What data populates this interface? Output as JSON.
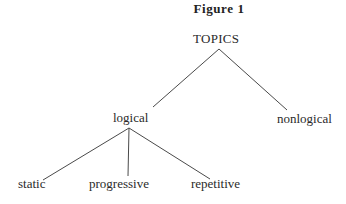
{
  "figure": {
    "title": "Figure 1"
  },
  "tree": {
    "root": {
      "label": "TOPICS"
    },
    "level1": [
      {
        "label": "logical"
      },
      {
        "label": "nonlogical"
      }
    ],
    "level2": [
      {
        "label": "static",
        "parent": "logical"
      },
      {
        "label": "progressive",
        "parent": "logical"
      },
      {
        "label": "repetitive",
        "parent": "logical"
      }
    ]
  },
  "colors": {
    "text": "#2a2a2a",
    "lines": "#4a4a4a",
    "background": "#ffffff"
  }
}
